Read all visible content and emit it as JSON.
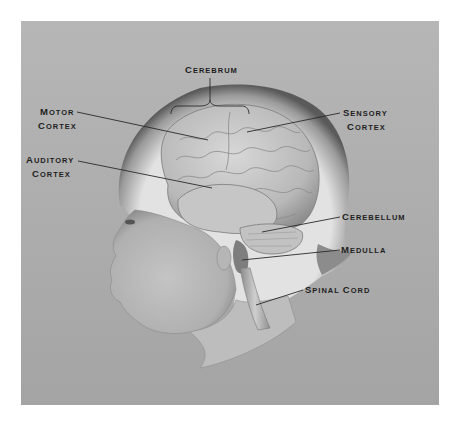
{
  "figure": {
    "background_color": "#ababab",
    "page_color": "#ffffff",
    "labels": [
      {
        "id": "cerebrum",
        "line1_initial": "C",
        "line1_rest": "EREBRUM",
        "line2_initial": "",
        "line2_rest": "",
        "text": "Cerebrum"
      },
      {
        "id": "motor-cortex",
        "line1_initial": "M",
        "line1_rest": "OTOR",
        "line2_initial": "C",
        "line2_rest": "ORTEX",
        "text": "Motor Cortex"
      },
      {
        "id": "sensory-cortex",
        "line1_initial": "S",
        "line1_rest": "ENSORY",
        "line2_initial": "C",
        "line2_rest": "ORTEX",
        "text": "Sensory Cortex"
      },
      {
        "id": "auditory-cortex",
        "line1_initial": "A",
        "line1_rest": "UDITORY",
        "line2_initial": "C",
        "line2_rest": "ORTEX",
        "text": "Auditory Cortex"
      },
      {
        "id": "cerebellum",
        "line1_initial": "C",
        "line1_rest": "EREBELLUM",
        "line2_initial": "",
        "line2_rest": "",
        "text": "Cerebellum"
      },
      {
        "id": "medulla",
        "line1_initial": "M",
        "line1_rest": "EDULLA",
        "line2_initial": "",
        "line2_rest": "",
        "text": "Medulla"
      },
      {
        "id": "spinal-cord",
        "line1_initial": "S",
        "line1_rest": "PINAL ",
        "line1_initial2": "C",
        "line1_rest2": "ORD",
        "line2_initial": "",
        "line2_rest": "",
        "text": "Spinal Cord"
      }
    ]
  }
}
